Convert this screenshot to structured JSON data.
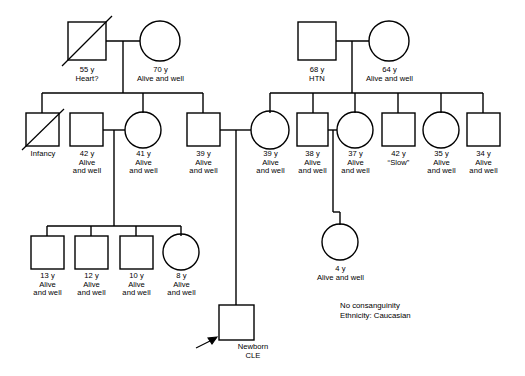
{
  "notes": {
    "consanguinity": "No consanguinity",
    "ethnicity": "Ethnicity: Caucasian"
  },
  "legend": {
    "square_meaning": "male",
    "circle_meaning": "female",
    "slash_meaning": "deceased",
    "arrow_meaning": "proband"
  },
  "generations": [
    {
      "id": "gen-1",
      "label": "generation-1-grandparents",
      "individuals": [
        {
          "id": "g1-m1",
          "sex": "male",
          "deceased": true,
          "label": "55 y\nHeart?",
          "age_text": "55 y",
          "status_text": "Heart?"
        },
        {
          "id": "g1-f1",
          "sex": "female",
          "deceased": false,
          "label": "70 y\nAlive and well",
          "age_text": "70 y",
          "status_text": "Alive and well"
        },
        {
          "id": "g1-m2",
          "sex": "male",
          "deceased": false,
          "label": "68 y\nHTN",
          "age_text": "68 y",
          "status_text": "HTN"
        },
        {
          "id": "g1-f2",
          "sex": "female",
          "deceased": false,
          "label": "64 y\nAlive and well",
          "age_text": "64 y",
          "status_text": "Alive and well"
        }
      ]
    },
    {
      "id": "gen-2",
      "label": "generation-2-parents",
      "individuals": [
        {
          "id": "g2-m-infancy",
          "sex": "male",
          "deceased": true,
          "label": "Infancy",
          "age_text": "Infancy",
          "status_text": ""
        },
        {
          "id": "g2-m-42",
          "sex": "male",
          "deceased": false,
          "label": "42 y\nAlive\nand well",
          "age_text": "42 y",
          "status_text": "Alive and well"
        },
        {
          "id": "g2-f-41",
          "sex": "female",
          "deceased": false,
          "label": "41 y\nAlive\nand well",
          "age_text": "41 y",
          "status_text": "Alive and well"
        },
        {
          "id": "g2-m-39",
          "sex": "male",
          "deceased": false,
          "label": "39 y\nAlive\nand well",
          "age_text": "39 y",
          "status_text": "Alive and well"
        },
        {
          "id": "g2-f-39",
          "sex": "female",
          "deceased": false,
          "label": "39 y\nAlive\nand well",
          "age_text": "39 y",
          "status_text": "Alive and well"
        },
        {
          "id": "g2-m-38",
          "sex": "male",
          "deceased": false,
          "label": "38 y\nAlive\nand well",
          "age_text": "38 y",
          "status_text": "Alive and well"
        },
        {
          "id": "g2-f-37",
          "sex": "female",
          "deceased": false,
          "label": "37 y\nAlive\nand well",
          "age_text": "37 y",
          "status_text": "Alive and well"
        },
        {
          "id": "g2-m-42b",
          "sex": "male",
          "deceased": false,
          "label": "42 y\n“Slow”",
          "age_text": "42 y",
          "status_text": "“Slow”"
        },
        {
          "id": "g2-f-35",
          "sex": "female",
          "deceased": false,
          "label": "35 y\nAlive\nand well",
          "age_text": "35 y",
          "status_text": "Alive and well"
        },
        {
          "id": "g2-m-34",
          "sex": "male",
          "deceased": false,
          "label": "34 y\nAlive\nand well",
          "age_text": "34 y",
          "status_text": "Alive and well"
        }
      ]
    },
    {
      "id": "gen-3",
      "label": "generation-3-children",
      "individuals": [
        {
          "id": "g3-m-13",
          "sex": "male",
          "deceased": false,
          "label": "13 y\nAlive\nand well",
          "age_text": "13 y",
          "status_text": "Alive and well"
        },
        {
          "id": "g3-m-12",
          "sex": "male",
          "deceased": false,
          "label": "12 y\nAlive\nand well",
          "age_text": "12 y",
          "status_text": "Alive and well"
        },
        {
          "id": "g3-m-10",
          "sex": "male",
          "deceased": false,
          "label": "10 y\nAlive\nand well",
          "age_text": "10 y",
          "status_text": "Alive and well"
        },
        {
          "id": "g3-f-8",
          "sex": "female",
          "deceased": false,
          "label": "8 y\nAlive\nand well",
          "age_text": "8 y",
          "status_text": "Alive and well"
        },
        {
          "id": "g3-f-4",
          "sex": "female",
          "deceased": false,
          "label": "4 y\nAlive and well",
          "age_text": "4 y",
          "status_text": "Alive and well"
        },
        {
          "id": "g3-proband",
          "sex": "male",
          "deceased": false,
          "proband": true,
          "label": "Newborn\nCLE",
          "age_text": "Newborn",
          "status_text": "CLE"
        }
      ]
    }
  ]
}
